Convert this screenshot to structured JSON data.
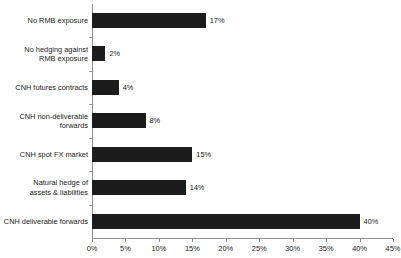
{
  "chart_data": {
    "type": "bar",
    "orientation": "horizontal",
    "title": "",
    "subtitle": "",
    "xlabel": "",
    "ylabel": "",
    "xlim": [
      0,
      45
    ],
    "xtick_values": [
      0,
      5,
      10,
      15,
      20,
      25,
      30,
      35,
      40,
      45
    ],
    "xtick_labels": [
      "0%",
      "5%",
      "10%",
      "15%",
      "20%",
      "25%",
      "30%",
      "35%",
      "40%",
      "45%"
    ],
    "grid": false,
    "legend": null,
    "bar_color": "#1c1c1c",
    "axis_color": "#8f8f8f",
    "categories": [
      "No RMB exposure",
      "No hedging against\nRMB exposure",
      "CNH futures contracts",
      "CNH non-deliverable\nforwards",
      "CNH spot FX market",
      "Natural hedge of\nassets & liabilities",
      "CNH deliverable forwards"
    ],
    "values": [
      17,
      2,
      4,
      8,
      15,
      14,
      40
    ],
    "value_labels": [
      "17%",
      "2%",
      "4%",
      "8%",
      "15%",
      "14%",
      "40%"
    ]
  }
}
